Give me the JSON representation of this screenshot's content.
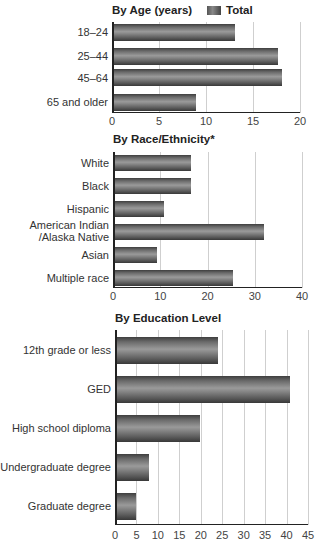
{
  "legend": {
    "label": "Total"
  },
  "charts": [
    {
      "title": "By Age (years)",
      "categories": [
        "18–24",
        "25–44",
        "45–64",
        "65 and older"
      ],
      "values": [
        13.0,
        17.6,
        18.0,
        8.8
      ],
      "ticks": [
        "0",
        "5",
        "10",
        "15",
        "20"
      ]
    },
    {
      "title": "By Race/Ethnicity*",
      "categories": [
        "White",
        "Black",
        "Hispanic",
        "American Indian\n/Alaska Native",
        "Asian",
        "Multiple race"
      ],
      "values": [
        16.4,
        16.3,
        10.6,
        31.8,
        9.0,
        25.2
      ],
      "ticks": [
        "0",
        "10",
        "20",
        "30",
        "40"
      ]
    },
    {
      "title": "By Education Level",
      "categories": [
        "12th grade or less",
        "GED",
        "High school diploma",
        "Undergraduate degree",
        "Graduate degree"
      ],
      "values": [
        23.8,
        40.5,
        19.6,
        7.7,
        4.7
      ],
      "ticks": [
        "0",
        "5",
        "10",
        "15",
        "20",
        "25",
        "30",
        "35",
        "40",
        "45"
      ]
    }
  ],
  "chart_data": [
    {
      "type": "bar",
      "orientation": "horizontal",
      "title": "By Age (years)",
      "categories": [
        "18–24",
        "25–44",
        "45–64",
        "65 and older"
      ],
      "series": [
        {
          "name": "Total",
          "values": [
            13.0,
            17.6,
            18.0,
            8.8
          ]
        }
      ],
      "xlabel": "",
      "ylabel": "",
      "xlim": [
        0,
        20
      ],
      "xticks": [
        0,
        5,
        10,
        15,
        20
      ],
      "grid": true,
      "legend_position": "top-right"
    },
    {
      "type": "bar",
      "orientation": "horizontal",
      "title": "By Race/Ethnicity*",
      "categories": [
        "White",
        "Black",
        "Hispanic",
        "American Indian/Alaska Native",
        "Asian",
        "Multiple race"
      ],
      "series": [
        {
          "name": "Total",
          "values": [
            16.4,
            16.3,
            10.6,
            31.8,
            9.0,
            25.2
          ]
        }
      ],
      "xlabel": "",
      "ylabel": "",
      "xlim": [
        0,
        40
      ],
      "xticks": [
        0,
        10,
        20,
        30,
        40
      ],
      "grid": true
    },
    {
      "type": "bar",
      "orientation": "horizontal",
      "title": "By Education Level",
      "categories": [
        "12th grade or less",
        "GED",
        "High school diploma",
        "Undergraduate degree",
        "Graduate degree"
      ],
      "series": [
        {
          "name": "Total",
          "values": [
            23.8,
            40.5,
            19.6,
            7.7,
            4.7
          ]
        }
      ],
      "xlabel": "",
      "ylabel": "",
      "xlim": [
        0,
        45
      ],
      "xticks": [
        0,
        5,
        10,
        15,
        20,
        25,
        30,
        35,
        40,
        45
      ],
      "grid": true
    }
  ]
}
